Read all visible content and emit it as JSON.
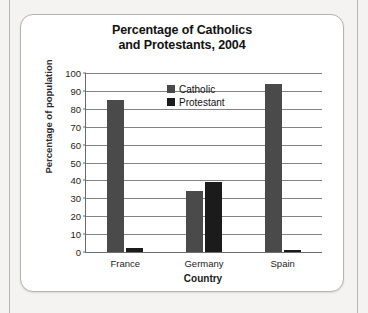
{
  "page": {
    "background_color": "#f4f3f1",
    "card_border_color": "#b5b3b0"
  },
  "chart_data": {
    "type": "bar",
    "title": "Percentage of Catholics and Protestants, 2004",
    "title_line1": "Percentage of Catholics",
    "title_line2": "and Protestants, 2004",
    "xlabel": "Country",
    "ylabel": "Percentage of population",
    "categories": [
      "France",
      "Germany",
      "Spain"
    ],
    "series": [
      {
        "name": "Catholic",
        "color": "#4a4a4a",
        "values": [
          85,
          34,
          94
        ]
      },
      {
        "name": "Protestant",
        "color": "#1b1b1b",
        "values": [
          2,
          39,
          1
        ]
      }
    ],
    "ylim": [
      0,
      100
    ],
    "ytick_step": 10,
    "yticks": [
      100,
      90,
      80,
      70,
      60,
      50,
      40,
      30,
      20,
      10,
      0
    ],
    "grid": true,
    "grid_axis": "y",
    "legend_position": "top-center"
  }
}
